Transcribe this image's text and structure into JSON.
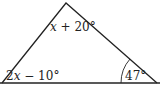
{
  "diagram": {
    "type": "triangle",
    "vertices": {
      "apex": {
        "x": 66,
        "y": 3
      },
      "left": {
        "x": 2,
        "y": 83
      },
      "right": {
        "x": 157,
        "y": 83
      }
    },
    "baseline": {
      "x1": 0,
      "x2": 160,
      "y": 83
    },
    "angles": {
      "top": {
        "var": "x",
        "rest": " + 20°"
      },
      "left": {
        "coef": "2",
        "var": "x",
        "rest": " − 10°"
      },
      "right": {
        "value": "47°"
      }
    },
    "colors": {
      "stroke": "#222222",
      "background": "#ffffff"
    }
  }
}
